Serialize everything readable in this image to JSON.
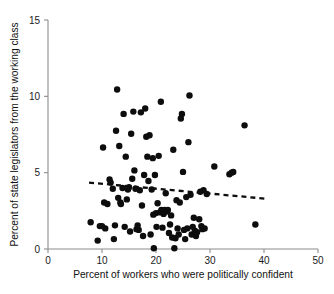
{
  "chart_data": {
    "type": "scatter",
    "title": "",
    "subtitle": "",
    "xlabel": "Percent of workers who were politically confident",
    "ylabel": "Percent of state legislators from the working class",
    "xlim": [
      0,
      50
    ],
    "ylim": [
      0,
      15
    ],
    "xticks": [
      0,
      10,
      20,
      30,
      40,
      50
    ],
    "yticks": [
      0,
      5,
      10,
      15
    ],
    "xtick_labels": [
      "0",
      "10",
      "20",
      "30",
      "40",
      "50"
    ],
    "ytick_labels": [
      "0",
      "5",
      "10",
      "15"
    ],
    "grid": false,
    "legend": null,
    "legend_position": "none",
    "marker": {
      "shape": "circle",
      "color": "#0d0d0d",
      "size_px": 6.4
    },
    "trend_line": {
      "label": "fitted regression line",
      "style": "dashed",
      "color": "#0d0d0d",
      "x_start": 7.6,
      "y_start": 4.35,
      "x_end": 40.2,
      "y_end": 3.3,
      "slope": -0.0322,
      "intercept": 4.595
    },
    "points": [
      [
        7.9,
        1.75
      ],
      [
        9.2,
        0.55
      ],
      [
        9.6,
        1.5
      ],
      [
        10.0,
        1.5
      ],
      [
        10.2,
        6.65
      ],
      [
        10.4,
        3.05
      ],
      [
        10.6,
        1.35
      ],
      [
        11.0,
        2.95
      ],
      [
        11.4,
        4.55
      ],
      [
        11.6,
        4.35
      ],
      [
        12.0,
        3.95
      ],
      [
        12.2,
        0.65
      ],
      [
        12.4,
        1.55
      ],
      [
        12.6,
        7.75
      ],
      [
        12.8,
        10.45
      ],
      [
        13.0,
        3.35
      ],
      [
        13.2,
        6.75
      ],
      [
        13.4,
        3.05
      ],
      [
        13.5,
        2.95
      ],
      [
        13.8,
        4.0
      ],
      [
        14.0,
        8.85
      ],
      [
        14.2,
        1.45
      ],
      [
        14.4,
        6.05
      ],
      [
        14.6,
        3.25
      ],
      [
        14.8,
        3.9
      ],
      [
        15.0,
        4.05
      ],
      [
        15.2,
        1.15
      ],
      [
        15.4,
        7.55
      ],
      [
        15.6,
        4.6
      ],
      [
        15.8,
        9.0
      ],
      [
        16.0,
        5.15
      ],
      [
        16.2,
        3.95
      ],
      [
        16.4,
        1.3
      ],
      [
        16.6,
        1.55
      ],
      [
        16.8,
        1.25
      ],
      [
        17.0,
        3.85
      ],
      [
        17.2,
        8.95
      ],
      [
        17.4,
        2.85
      ],
      [
        17.6,
        0.85
      ],
      [
        17.8,
        4.85
      ],
      [
        18.0,
        9.2
      ],
      [
        18.2,
        7.35
      ],
      [
        18.4,
        6.05
      ],
      [
        18.6,
        4.45
      ],
      [
        18.8,
        7.45
      ],
      [
        19.0,
        0.95
      ],
      [
        19.2,
        3.9
      ],
      [
        19.4,
        5.95
      ],
      [
        19.5,
        2.25
      ],
      [
        19.6,
        0.05
      ],
      [
        19.8,
        4.85
      ],
      [
        20.0,
        2.35
      ],
      [
        20.1,
        1.45
      ],
      [
        20.3,
        3.0
      ],
      [
        20.5,
        6.1
      ],
      [
        20.7,
        2.4
      ],
      [
        20.9,
        9.65
      ],
      [
        21.0,
        2.55
      ],
      [
        21.2,
        1.4
      ],
      [
        21.4,
        2.3
      ],
      [
        21.6,
        2.55
      ],
      [
        21.8,
        3.65
      ],
      [
        22.0,
        2.45
      ],
      [
        22.2,
        2.55
      ],
      [
        22.4,
        1.05
      ],
      [
        22.6,
        1.6
      ],
      [
        22.8,
        2.2
      ],
      [
        23.0,
        0.75
      ],
      [
        23.2,
        6.5
      ],
      [
        23.4,
        0.05
      ],
      [
        23.6,
        0.7
      ],
      [
        23.8,
        3.2
      ],
      [
        24.0,
        1.35
      ],
      [
        24.2,
        0.95
      ],
      [
        24.4,
        3.05
      ],
      [
        24.6,
        8.55
      ],
      [
        24.8,
        8.85
      ],
      [
        25.0,
        5.05
      ],
      [
        25.2,
        1.25
      ],
      [
        25.4,
        0.65
      ],
      [
        25.6,
        3.4
      ],
      [
        25.8,
        1.35
      ],
      [
        26.0,
        7.0
      ],
      [
        26.2,
        10.05
      ],
      [
        26.4,
        3.55
      ],
      [
        26.6,
        0.95
      ],
      [
        26.8,
        1.45
      ],
      [
        27.0,
        2.05
      ],
      [
        27.2,
        1.2
      ],
      [
        27.4,
        0.85
      ],
      [
        27.6,
        1.1
      ],
      [
        28.0,
        1.95
      ],
      [
        28.2,
        3.75
      ],
      [
        28.4,
        1.5
      ],
      [
        28.6,
        1.3
      ],
      [
        28.8,
        3.85
      ],
      [
        29.0,
        1.35
      ],
      [
        29.4,
        3.6
      ],
      [
        30.8,
        5.4
      ],
      [
        33.6,
        4.9
      ],
      [
        34.0,
        5.0
      ],
      [
        34.3,
        5.05
      ],
      [
        36.4,
        8.1
      ],
      [
        38.4,
        1.6
      ]
    ]
  }
}
